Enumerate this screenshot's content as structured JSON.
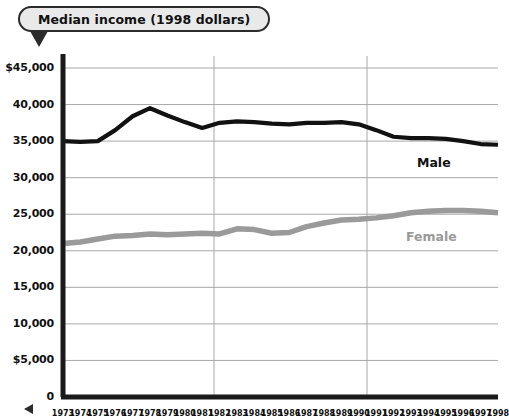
{
  "title": {
    "text": "Median income (1998 dollars)"
  },
  "chart_data": {
    "type": "line",
    "title": "Median income (1998 dollars)",
    "xlabel": "",
    "ylabel": "",
    "ylim": [
      0,
      45000
    ],
    "ytick_values": [
      45000,
      40000,
      35000,
      30000,
      25000,
      20000,
      15000,
      10000,
      5000,
      0
    ],
    "ytick_labels": [
      "$45,000",
      "40,000",
      "35,000",
      "30,000",
      "25,000",
      "20,000",
      "15,000",
      "10,000",
      "$5,000",
      "0"
    ],
    "grid": "horizontal-major-plus-two-vertical",
    "legend_position": "inline-right",
    "x": [
      "1973",
      "1974",
      "1975",
      "1976",
      "1977",
      "1978",
      "1979",
      "1980",
      "1981",
      "1982",
      "1983",
      "1984",
      "1985",
      "1986",
      "1987",
      "1988",
      "1989",
      "1990",
      "1991",
      "1992",
      "1993",
      "1994",
      "1995",
      "1996",
      "1997",
      "1998"
    ],
    "xtick_labels": [
      "1973",
      "1974",
      "1975",
      "1976",
      "1977",
      "1978",
      "1979",
      "1980",
      "1981",
      "1982",
      "1983",
      "1984",
      "1985",
      "1986",
      "1987",
      "1988",
      "1989",
      "1990",
      "1991",
      "1992",
      "1993",
      "1994",
      "1995",
      "1996",
      "1997",
      "1998"
    ],
    "series": [
      {
        "name": "Male",
        "color": "#111111",
        "values": [
          35000,
          34900,
          35000,
          36500,
          38400,
          39500,
          38500,
          37600,
          36800,
          37500,
          37700,
          37600,
          37400,
          37300,
          37500,
          37500,
          37600,
          37300,
          36500,
          35600,
          35400,
          35400,
          35300,
          35000,
          34600,
          34500
        ]
      },
      {
        "name": "Female",
        "color": "#9a9a9a",
        "values": [
          21000,
          21200,
          21600,
          22000,
          22100,
          22300,
          22200,
          22300,
          22400,
          22300,
          23000,
          22900,
          22400,
          22500,
          23300,
          23800,
          24200,
          24300,
          24500,
          24800,
          25200,
          25400,
          25500,
          25500,
          25400,
          25200
        ]
      }
    ],
    "series_labels": [
      {
        "name": "Male",
        "color": "#111111"
      },
      {
        "name": "Female",
        "color": "#9a9a9a"
      }
    ]
  }
}
